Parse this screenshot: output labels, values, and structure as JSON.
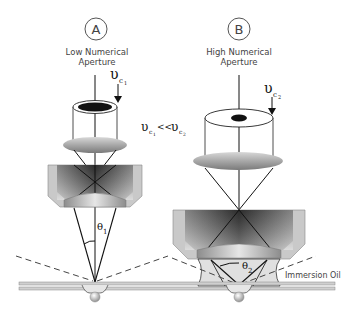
{
  "panels": [
    {
      "id": "A",
      "letter": "A",
      "title_line1": "Low Numerical",
      "title_line2": "Aperture",
      "nu_symbol": "υ",
      "nu_sub": "c",
      "nu_subsub": "1",
      "angle_symbol": "θ",
      "angle_sub": "1"
    },
    {
      "id": "B",
      "letter": "B",
      "title_line1": "High Numerical",
      "title_line2": "Aperture",
      "nu_symbol": "υ",
      "nu_sub": "c",
      "nu_subsub": "2",
      "angle_symbol": "θ",
      "angle_sub": "2"
    }
  ],
  "comparison": {
    "left_symbol": "υ",
    "left_sub": "c",
    "left_subsub": "1",
    "operator": "<<",
    "right_symbol": "υ",
    "right_sub": "c",
    "right_subsub": "2"
  },
  "annotations": {
    "immersion_oil": "Immersion Oil"
  },
  "colors": {
    "housing": "#c8c8c8",
    "housing_dark": "#555555",
    "lens": "#b0b0b0",
    "oil": "#e2e2e2",
    "line": "#111111"
  }
}
